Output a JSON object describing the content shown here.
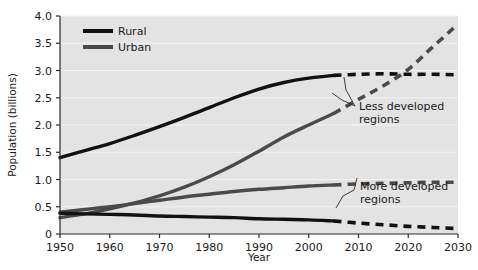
{
  "chart_data": {
    "type": "line",
    "title": "",
    "xlabel": "Year",
    "ylabel": "Population (billions)",
    "xlim": [
      1950,
      2030
    ],
    "ylim": [
      0,
      4.0
    ],
    "xticks": [
      "1950",
      "1960",
      "1970",
      "1980",
      "1990",
      "2000",
      "2010",
      "2020",
      "2030"
    ],
    "yticks": [
      "0",
      "0.5",
      "1.0",
      "1.5",
      "2.0",
      "2.5",
      "3.0",
      "3.5",
      "4.0"
    ],
    "grid": true,
    "legend_position": "top-left",
    "projection_start_year": 2005,
    "legend": [
      {
        "name": "Rural",
        "color": "#111111",
        "style": "solid"
      },
      {
        "name": "Urban",
        "color": "#4a4a4a",
        "style": "solid"
      }
    ],
    "annotations": [
      {
        "text_line1": "Less developed",
        "text_line2": "regions"
      },
      {
        "text_line1": "More developed",
        "text_line2": "regions"
      }
    ],
    "x": [
      1950,
      1955,
      1960,
      1965,
      1970,
      1975,
      1980,
      1985,
      1990,
      1995,
      2000,
      2005,
      2010,
      2015,
      2020,
      2025,
      2030
    ],
    "series": [
      {
        "name": "Less developed regions - Rural",
        "region": "Less developed",
        "type": "Rural",
        "color": "#111111",
        "values": [
          1.4,
          1.53,
          1.66,
          1.81,
          1.97,
          2.14,
          2.32,
          2.5,
          2.66,
          2.78,
          2.86,
          2.91,
          2.93,
          2.94,
          2.93,
          2.93,
          2.92
        ]
      },
      {
        "name": "Less developed regions - Urban",
        "region": "Less developed",
        "type": "Urban",
        "color": "#4a4a4a",
        "values": [
          0.3,
          0.37,
          0.46,
          0.57,
          0.7,
          0.86,
          1.05,
          1.27,
          1.52,
          1.78,
          2.0,
          2.21,
          2.47,
          2.72,
          3.02,
          3.44,
          3.85
        ]
      },
      {
        "name": "More developed regions - Urban",
        "region": "More developed",
        "type": "Urban",
        "color": "#4a4a4a",
        "values": [
          0.4,
          0.45,
          0.5,
          0.56,
          0.62,
          0.68,
          0.73,
          0.78,
          0.82,
          0.85,
          0.88,
          0.9,
          0.92,
          0.93,
          0.94,
          0.95,
          0.95
        ]
      },
      {
        "name": "More developed regions - Rural",
        "region": "More developed",
        "type": "Rural",
        "color": "#111111",
        "values": [
          0.38,
          0.37,
          0.36,
          0.35,
          0.33,
          0.32,
          0.31,
          0.3,
          0.28,
          0.27,
          0.26,
          0.24,
          0.2,
          0.17,
          0.14,
          0.12,
          0.1
        ]
      }
    ]
  }
}
